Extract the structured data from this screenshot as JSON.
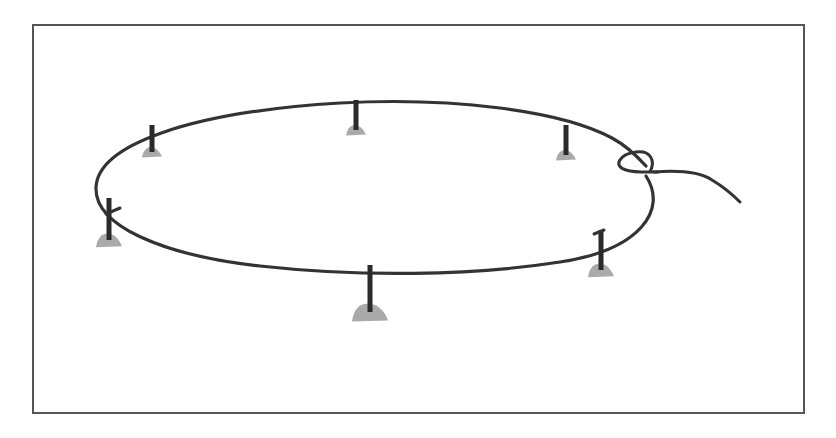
{
  "figure": {
    "colors": {
      "rope": "#333333",
      "stake": "#2a2a2a",
      "mound": "#aaaaaa",
      "frame": "#555555",
      "background": "#ffffff"
    },
    "stakes": [
      {
        "name": "stake-top-left",
        "x": 152,
        "top": 125,
        "bottom": 152,
        "mound_w": 20
      },
      {
        "name": "stake-top-center",
        "x": 356,
        "top": 100,
        "bottom": 130,
        "mound_w": 20
      },
      {
        "name": "stake-top-right",
        "x": 566,
        "top": 125,
        "bottom": 155,
        "mound_w": 20
      },
      {
        "name": "stake-left",
        "x": 109,
        "top": 198,
        "bottom": 240,
        "mound_w": 26
      },
      {
        "name": "stake-bottom-center",
        "x": 370,
        "top": 265,
        "bottom": 312,
        "mound_w": 36
      },
      {
        "name": "stake-right",
        "x": 601,
        "top": 230,
        "bottom": 270,
        "mound_w": 26
      }
    ],
    "knot": {
      "x": 640,
      "y": 162
    },
    "loose_end": {
      "x": 740,
      "y": 202
    }
  }
}
